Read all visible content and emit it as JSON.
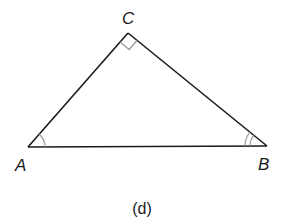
{
  "figure": {
    "caption": "(d)",
    "vertices": {
      "A": {
        "label": "A",
        "x": 28,
        "y": 147
      },
      "B": {
        "label": "B",
        "x": 267,
        "y": 146
      },
      "C": {
        "label": "C",
        "x": 128,
        "y": 33
      }
    },
    "markers": {
      "C": "right-angle",
      "A": "single-arc",
      "B": "double-arc"
    },
    "colors": {
      "line": "#1a1a1a",
      "marker": "#9a9a9a"
    }
  }
}
